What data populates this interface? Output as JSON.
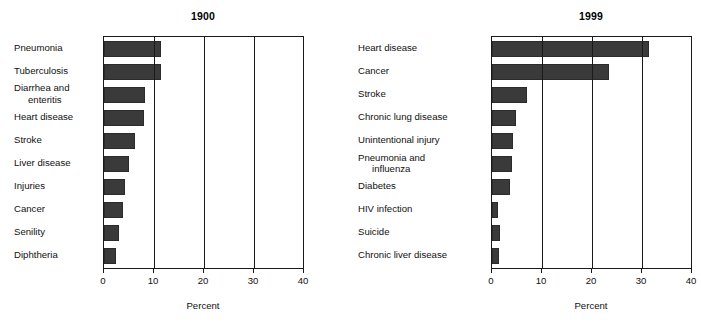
{
  "figure": {
    "axis_title": "Percent",
    "bar_color": "#3a3a3a",
    "frame_color": "#1a1a1a",
    "background": "#ffffff"
  },
  "chart_data": [
    {
      "type": "bar",
      "orientation": "horizontal",
      "title": "1900",
      "xlabel": "Percent",
      "ylabel": "",
      "xlim": [
        0,
        40
      ],
      "xticks": [
        0,
        10,
        20,
        30,
        40
      ],
      "xticklabels": [
        "0",
        "10",
        "20",
        "30",
        "40"
      ],
      "grid": "vertical gridlines at 10, 20, 30",
      "legend": "none",
      "categories": [
        "Pneumonia",
        "Tuberculosis",
        "Diarrhea and\nenteritis",
        "Heart disease",
        "Stroke",
        "Liver disease",
        "Injuries",
        "Cancer",
        "Senility",
        "Diphtheria"
      ],
      "values": [
        11.4,
        11.3,
        8.2,
        8.0,
        6.2,
        5.0,
        4.2,
        3.7,
        2.9,
        2.3
      ]
    },
    {
      "type": "bar",
      "orientation": "horizontal",
      "title": "1999",
      "xlabel": "Percent",
      "ylabel": "",
      "xlim": [
        0,
        40
      ],
      "xticks": [
        0,
        10,
        20,
        30,
        40
      ],
      "xticklabels": [
        "0",
        "10",
        "20",
        "30",
        "40"
      ],
      "grid": "vertical gridlines at 10, 20, 30",
      "legend": "none",
      "categories": [
        "Heart disease",
        "Cancer",
        "Stroke",
        "Chronic lung disease",
        "Unintentional injury",
        "Pneumonia and\ninfluenza",
        "Diabetes",
        "HIV infection",
        "Suicide",
        "Chronic liver disease"
      ],
      "values": [
        31.3,
        23.4,
        7.0,
        4.7,
        4.1,
        3.9,
        3.5,
        1.1,
        1.5,
        1.3
      ]
    }
  ]
}
